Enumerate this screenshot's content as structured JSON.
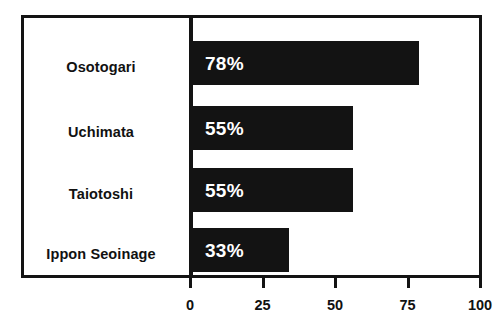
{
  "chart_data": {
    "type": "bar",
    "orientation": "horizontal",
    "title": "",
    "subtitle": "",
    "xlabel": "",
    "ylabel": "",
    "categories": [
      "Osotogari",
      "Uchimata",
      "Taiotoshi",
      "Ippon Seoinage"
    ],
    "values": [
      78,
      55,
      55,
      33
    ],
    "data_labels": [
      "78%",
      "55%",
      "55%",
      "33%"
    ],
    "xlim": [
      0,
      100
    ],
    "xticks": [
      0,
      25,
      50,
      75,
      100
    ],
    "xtick_labels": [
      "0",
      "25",
      "50",
      "75",
      "100"
    ],
    "grid": false,
    "legend": false,
    "legend_position": "none",
    "bar_color": "#131313",
    "data_label_color": "#ffffff",
    "axis_color": "#131313",
    "background_color": "#ffffff",
    "frame": true
  },
  "axis": {
    "ticks": [
      {
        "value": 0,
        "label": "0"
      },
      {
        "value": 25,
        "label": "25"
      },
      {
        "value": 50,
        "label": "50"
      },
      {
        "value": 75,
        "label": "75"
      },
      {
        "value": 100,
        "label": "100"
      }
    ]
  },
  "bars": [
    {
      "category": "Osotogari",
      "value": 78,
      "label": "78%"
    },
    {
      "category": "Uchimata",
      "value": 55,
      "label": "55%"
    },
    {
      "category": "Taiotoshi",
      "value": 55,
      "label": "55%"
    },
    {
      "category": "Ippon Seoinage",
      "value": 33,
      "label": "33%"
    }
  ]
}
